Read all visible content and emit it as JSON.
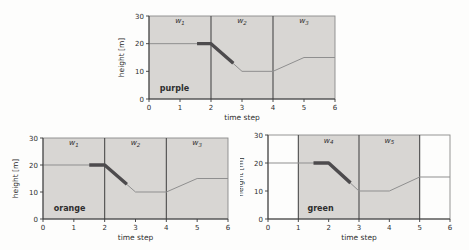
{
  "figure_title": "sliding-window trajectory figure",
  "colors": {
    "page_background": "#fdfdfc",
    "region_shading": "#d8d6d3",
    "trajectory_line": "#8f8f8f",
    "highlight_segment": "#4d4b4d",
    "plot_border": "#8a8a8a",
    "region_divider": "#4a4a4a",
    "axis_spine": "#3a3a3a",
    "text": "#2e2e2e"
  },
  "chart_data": [
    {
      "id": "purple",
      "type": "line",
      "title": "purple",
      "xlabel": "time step",
      "ylabel": "height [m]",
      "xlim": [
        0,
        6
      ],
      "ylim": [
        0,
        30
      ],
      "xticks": [
        "0",
        "1",
        "2",
        "3",
        "4",
        "5",
        "6"
      ],
      "xtick_values": [
        0,
        1,
        2,
        3,
        4,
        5,
        6
      ],
      "yticks": [
        "0",
        "10",
        "20",
        "30"
      ],
      "ytick_values": [
        0,
        10,
        20,
        30
      ],
      "grid": false,
      "legend": "none",
      "regions": [
        {
          "label": "w",
          "sub": "1",
          "from": 0,
          "to": 2,
          "shaded": true
        },
        {
          "label": "w",
          "sub": "2",
          "from": 2,
          "to": 4,
          "shaded": true
        },
        {
          "label": "w",
          "sub": "3",
          "from": 4,
          "to": 6,
          "shaded": true
        }
      ],
      "region_label_y": 27.3,
      "series": [
        {
          "name": "trajectory",
          "style": "thin",
          "points": [
            [
              0,
              20
            ],
            [
              2,
              20
            ],
            [
              3,
              10
            ],
            [
              4,
              10
            ],
            [
              5,
              15
            ],
            [
              6,
              15
            ]
          ]
        },
        {
          "name": "highlighted-window-segment",
          "style": "thick",
          "points": [
            [
              1.55,
              20
            ],
            [
              2,
              20
            ],
            [
              2.72,
              12.9
            ]
          ]
        }
      ],
      "title_xy": [
        0.35,
        3.0
      ],
      "layout": {
        "left": 110,
        "top": 0,
        "width": 252,
        "height": 125,
        "plot": {
          "left": 39,
          "top": 16,
          "right": 225,
          "bottom": 99
        }
      }
    },
    {
      "id": "orange",
      "type": "line",
      "title": "orange",
      "xlabel": "time step",
      "ylabel": "height [m]",
      "xlim": [
        0,
        6
      ],
      "ylim": [
        0,
        30
      ],
      "xticks": [
        "0",
        "1",
        "2",
        "3",
        "4",
        "5",
        "6"
      ],
      "xtick_values": [
        0,
        1,
        2,
        3,
        4,
        5,
        6
      ],
      "yticks": [
        "0",
        "10",
        "20",
        "30"
      ],
      "ytick_values": [
        0,
        10,
        20,
        30
      ],
      "grid": false,
      "legend": "none",
      "regions": [
        {
          "label": "w",
          "sub": "1",
          "from": 0,
          "to": 2,
          "shaded": true
        },
        {
          "label": "w",
          "sub": "2",
          "from": 2,
          "to": 4,
          "shaded": true
        },
        {
          "label": "w",
          "sub": "3",
          "from": 4,
          "to": 6,
          "shaded": true
        }
      ],
      "region_label_y": 27.3,
      "series": [
        {
          "name": "trajectory",
          "style": "thin",
          "points": [
            [
              0,
              20
            ],
            [
              2,
              20
            ],
            [
              3,
              10
            ],
            [
              4,
              10
            ],
            [
              5,
              15
            ],
            [
              6,
              15
            ]
          ]
        },
        {
          "name": "highlighted-window-segment",
          "style": "thick",
          "points": [
            [
              1.5,
              20
            ],
            [
              2,
              20
            ],
            [
              2.72,
              12.9
            ]
          ]
        }
      ],
      "title_xy": [
        0.35,
        3.0
      ],
      "layout": {
        "left": 0,
        "top": 125,
        "width": 245,
        "height": 125,
        "plot": {
          "left": 43,
          "top": 13,
          "right": 228,
          "bottom": 94
        }
      }
    },
    {
      "id": "green",
      "type": "line",
      "title": "green",
      "xlabel": "time step",
      "ylabel": "height [m]",
      "xlim": [
        0,
        6
      ],
      "ylim": [
        0,
        30
      ],
      "xticks": [
        "0",
        "1",
        "2",
        "3",
        "4",
        "5",
        "6"
      ],
      "xtick_values": [
        0,
        1,
        2,
        3,
        4,
        5,
        6
      ],
      "yticks": [
        "0",
        "10",
        "20",
        "30"
      ],
      "ytick_values": [
        0,
        10,
        20,
        30
      ],
      "grid": false,
      "legend": "none",
      "regions": [
        {
          "label": "w",
          "sub": "4",
          "from": 1,
          "to": 3,
          "shaded": true
        },
        {
          "label": "w",
          "sub": "5",
          "from": 3,
          "to": 5,
          "shaded": true
        }
      ],
      "region_label_y": 27.3,
      "series": [
        {
          "name": "trajectory",
          "style": "thin",
          "points": [
            [
              0,
              20
            ],
            [
              2,
              20
            ],
            [
              3,
              10
            ],
            [
              4,
              10
            ],
            [
              5,
              15
            ],
            [
              6,
              15
            ]
          ]
        },
        {
          "name": "highlighted-window-segment",
          "style": "thick",
          "points": [
            [
              1.5,
              20
            ],
            [
              2,
              20
            ],
            [
              2.72,
              12.9
            ]
          ]
        }
      ],
      "title_xy": [
        1.3,
        3.0
      ],
      "layout": {
        "left": 240,
        "top": 125,
        "width": 229,
        "height": 125,
        "plot": {
          "left": 28,
          "top": 10,
          "right": 210,
          "bottom": 94
        }
      }
    }
  ],
  "fonts": {
    "tick_size": 7,
    "axis_label_size": 7.5,
    "region_label_size": 7.5,
    "region_sub_size": 5.5,
    "title_size": 8
  }
}
